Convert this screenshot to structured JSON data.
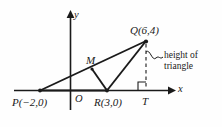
{
  "figure": {
    "type": "coordinate-geometry-diagram",
    "background_color": "#fefefe",
    "ink_color": "#1a1a1a",
    "axes": {
      "x_label": "x",
      "y_label": "y",
      "origin_label": "O"
    },
    "points": {
      "P": {
        "label": "P(−2,0)",
        "name": "P",
        "x": -2,
        "y": 0
      },
      "R": {
        "label": "R(3,0)",
        "name": "R",
        "x": 3,
        "y": 0
      },
      "Q": {
        "label": "Q(6,4)",
        "name": "Q",
        "x": 6,
        "y": 4
      },
      "T": {
        "label": "T",
        "name": "T",
        "x": 6,
        "y": 0
      },
      "M": {
        "label": "M",
        "name": "M"
      }
    },
    "annotation": {
      "height_line1": "height of",
      "height_line2": "triangle"
    }
  }
}
